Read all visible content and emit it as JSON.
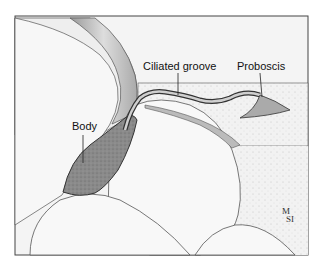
{
  "figure": {
    "labels": {
      "body": "Body",
      "ciliated_groove": "Ciliated groove",
      "proboscis": "Proboscis"
    },
    "signature": {
      "line1": "M",
      "line2": "S",
      "line3": "I"
    }
  }
}
